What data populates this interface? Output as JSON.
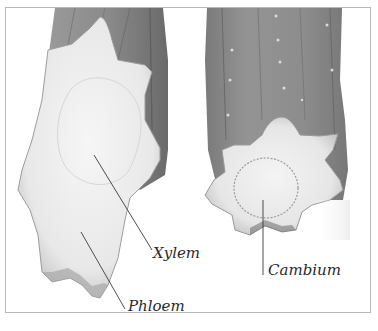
{
  "figure": {
    "labels": {
      "xylem": "Xylem",
      "phloem": "Phloem",
      "cambium": "Cambium"
    },
    "colors": {
      "stem_skin": "#8f8f8f",
      "stem_skin_dark": "#6e6e6e",
      "cut_face": "#ededed",
      "cut_face_shadow": "#c9c9c9",
      "border": "#b8b8b8",
      "leader_line": "#3a3a3a",
      "label_text": "#2a2a2a"
    }
  }
}
